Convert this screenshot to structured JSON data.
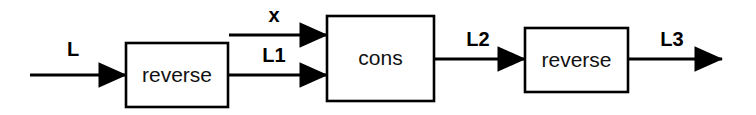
{
  "diagram": {
    "background_color": "#ffffff",
    "stroke_color": "#000000",
    "nodes": [
      {
        "id": "reverse-1",
        "label": "reverse",
        "x": 126,
        "y": 43,
        "width": 102,
        "height": 64
      },
      {
        "id": "cons",
        "label": "cons",
        "x": 327,
        "y": 16,
        "width": 107,
        "height": 85
      },
      {
        "id": "reverse-2",
        "label": "reverse",
        "x": 525,
        "y": 28,
        "width": 103,
        "height": 64
      }
    ],
    "edges": [
      {
        "id": "edge-L",
        "label": "L",
        "label_x": 73,
        "label_y": 56,
        "x1": 30,
        "y1": 75,
        "x2": 126,
        "y2": 75
      },
      {
        "id": "edge-x",
        "label": "x",
        "label_x": 274,
        "label_y": 22,
        "x1": 229,
        "y1": 35,
        "x2": 327,
        "y2": 35
      },
      {
        "id": "edge-L1",
        "label": "L1",
        "label_x": 274,
        "label_y": 62,
        "x1": 228,
        "y1": 75,
        "x2": 327,
        "y2": 75
      },
      {
        "id": "edge-L2",
        "label": "L2",
        "label_x": 478,
        "label_y": 46,
        "x1": 434,
        "y1": 59,
        "x2": 525,
        "y2": 59
      },
      {
        "id": "edge-L3",
        "label": "L3",
        "label_x": 672,
        "label_y": 46,
        "x1": 628,
        "y1": 59,
        "x2": 722,
        "y2": 59
      }
    ]
  }
}
